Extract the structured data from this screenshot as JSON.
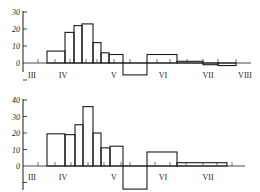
{
  "chart_data": [
    {
      "type": "bar",
      "subtype": "step-histogram",
      "title": "",
      "xlabel": "",
      "ylabel": "",
      "ylim": [
        -10,
        30
      ],
      "yticks": [
        0,
        10,
        20,
        30
      ],
      "month_labels": [
        "III",
        "IV",
        "V",
        "VI",
        "VII",
        "VIII"
      ],
      "grid": false,
      "bins": [
        {
          "x0": 3.6,
          "x1": 4.0,
          "value": 7
        },
        {
          "x0": 4.0,
          "x1": 4.2,
          "value": 18
        },
        {
          "x0": 4.2,
          "x1": 4.4,
          "value": 22
        },
        {
          "x0": 4.4,
          "x1": 4.6,
          "value": 23
        },
        {
          "x0": 4.6,
          "x1": 4.8,
          "value": 12
        },
        {
          "x0": 4.8,
          "x1": 4.95,
          "value": 6
        },
        {
          "x0": 4.95,
          "x1": 5.2,
          "value": 5
        },
        {
          "x0": 5.2,
          "x1": 5.7,
          "value": -7
        },
        {
          "x0": 5.7,
          "x1": 6.3,
          "value": 5
        },
        {
          "x0": 6.3,
          "x1": 6.85,
          "value": 1
        },
        {
          "x0": 6.85,
          "x1": 7.2,
          "value": -1
        },
        {
          "x0": 7.2,
          "x1": 7.55,
          "value": -1.5
        }
      ]
    },
    {
      "type": "bar",
      "subtype": "step-histogram",
      "title": "",
      "xlabel": "",
      "ylabel": "",
      "ylim": [
        -15,
        40
      ],
      "yticks": [
        0,
        10,
        20,
        30,
        40
      ],
      "month_labels": [
        "III",
        "IV",
        "V",
        "VI",
        "VII"
      ],
      "grid": false,
      "bins": [
        {
          "x0": 3.6,
          "x1": 4.0,
          "value": 19.5
        },
        {
          "x0": 4.0,
          "x1": 4.2,
          "value": 19
        },
        {
          "x0": 4.2,
          "x1": 4.4,
          "value": 25
        },
        {
          "x0": 4.4,
          "x1": 4.6,
          "value": 36
        },
        {
          "x0": 4.6,
          "x1": 4.8,
          "value": 20
        },
        {
          "x0": 4.8,
          "x1": 4.95,
          "value": 11
        },
        {
          "x0": 4.95,
          "x1": 5.2,
          "value": 12
        },
        {
          "x0": 5.2,
          "x1": 5.7,
          "value": -14
        },
        {
          "x0": 5.7,
          "x1": 6.3,
          "value": 8.5
        },
        {
          "x0": 6.3,
          "x1": 7.35,
          "value": 2
        }
      ]
    }
  ],
  "panels": [
    {
      "layout": {
        "axis_x": 23,
        "zero_y": 63,
        "px_per_unit": 1.7,
        "axis_end": 251,
        "label_y": 75,
        "ytick_bottom": 72
      },
      "x_edges_px": [
        47,
        65,
        74,
        82,
        93,
        101,
        109,
        123,
        147,
        177,
        203,
        218,
        236
      ],
      "minor_ticks_px": [
        38,
        55,
        70,
        86,
        97,
        114,
        130,
        157,
        170,
        187,
        203,
        218,
        236
      ],
      "month_label_px": [
        32,
        63,
        114,
        163,
        208,
        245
      ]
    },
    {
      "layout": {
        "axis_x": 23,
        "zero_y": 166,
        "px_per_unit": 1.65,
        "axis_end": 245,
        "label_y": 177,
        "ytick_bottom": 190
      },
      "x_edges_px": [
        47,
        65,
        75,
        83,
        93,
        101,
        110,
        123,
        147,
        177,
        227
      ],
      "minor_ticks_px": [
        38,
        55,
        71,
        88,
        104,
        121,
        130,
        155,
        170,
        186,
        203,
        217,
        232
      ],
      "month_label_px": [
        32,
        63,
        114,
        163,
        208
      ]
    }
  ],
  "colors": {
    "line": "#1a1a1a",
    "text": "#222222",
    "background": "#ffffff"
  }
}
